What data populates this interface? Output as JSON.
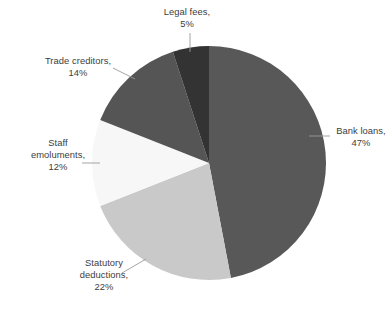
{
  "chart_data": {
    "type": "pie",
    "title": "",
    "subtitle": "",
    "xlabel": "",
    "ylabel": "",
    "legend_position": "none",
    "grid": false,
    "labels_format": "{category}, {value}%",
    "total": 100,
    "start_angle_deg": 0,
    "direction": "clockwise",
    "categories": [
      "Bank loans",
      "Statutory deductions",
      "Staff emoluments",
      "Trade creditors",
      "Legal fees"
    ],
    "values": [
      47,
      22,
      12,
      14,
      5
    ],
    "colors": [
      "#585858",
      "#c9c9c9",
      "#f7f7f7",
      "#555555",
      "#333333"
    ],
    "slices": [
      {
        "name": "Bank loans",
        "value": 47,
        "unit": "%",
        "color": "#585858",
        "label_line1": "Bank loans,",
        "label_line2": "47%",
        "label_line3": ""
      },
      {
        "name": "Statutory deductions",
        "value": 22,
        "unit": "%",
        "color": "#c9c9c9",
        "label_line1": "Statutory",
        "label_line2": "deductions,",
        "label_line3": "22%"
      },
      {
        "name": "Staff emoluments",
        "value": 12,
        "unit": "%",
        "color": "#f7f7f7",
        "label_line1": "Staff",
        "label_line2": "emoluments,",
        "label_line3": "12%"
      },
      {
        "name": "Trade creditors",
        "value": 14,
        "unit": "%",
        "color": "#555555",
        "label_line1": "Trade creditors,",
        "label_line2": "14%",
        "label_line3": ""
      },
      {
        "name": "Legal fees",
        "value": 5,
        "unit": "%",
        "color": "#333333",
        "label_line1": "Legal fees,",
        "label_line2": "5%",
        "label_line3": ""
      }
    ]
  },
  "style": {
    "background": "#ffffff",
    "text_color": "#3d3d3d",
    "leader_line_color": "#9a9a9a"
  }
}
